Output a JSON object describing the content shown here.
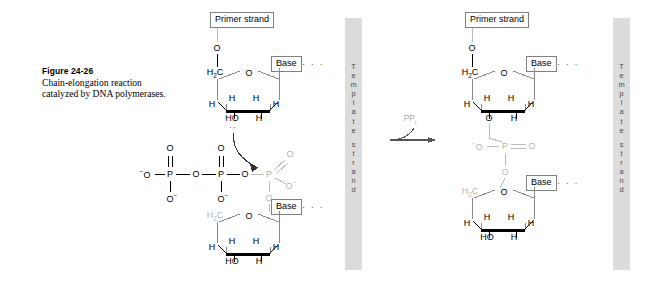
{
  "figure": {
    "number_label": "Figure 24-26",
    "caption_line1": "Chain-elongation reaction",
    "caption_line2": "catalyzed by DNA",
    "caption_line3": "polymerases."
  },
  "colors": {
    "background": "#ffffff",
    "ink": "#000000",
    "template_bar": "#dcdcdc",
    "template_text": "#4a4a4a",
    "gray_structure": "#b4b4b4",
    "box_border": "#808080"
  },
  "template_strands": [
    {
      "name": "template-strand-left",
      "text": "Template strand"
    },
    {
      "name": "template-strand-right",
      "text": "Template strand"
    }
  ],
  "reaction": {
    "byproduct_label": "PP",
    "byproduct_subscript": "i",
    "arrow_name": "reaction-arrow"
  },
  "labels": {
    "primer_strand": "Primer strand",
    "base": "Base",
    "continuation_dots": "· · ·",
    "O": "O",
    "H": "H",
    "HO": "HO",
    "P": "P",
    "H2C": "H<sub>2</sub>C",
    "O_minus": "O<sup>−</sup>",
    "minus_O": "<sup>−</sup>O"
  },
  "reactant_side": {
    "name": "reactant-structure",
    "primer_nucleotide": {
      "primer_strand_box": "Primer strand",
      "bridging_O": "O",
      "c5_label": "H2C",
      "ring_O": "O",
      "base_box": "Base",
      "base_dots": "· · ·",
      "h_labels": [
        "H",
        "H",
        "H",
        "H"
      ],
      "hydroxyl_label": "HO",
      "lone_pair": "··"
    },
    "triphosphate": {
      "terminal_O_minus": "−O",
      "phosphorus_labels": [
        "P",
        "P",
        "P"
      ],
      "bridging_O_labels": [
        "O",
        "O"
      ],
      "double_bond_O_labels": [
        "O",
        "O",
        "O"
      ],
      "O_minus_labels": [
        "O−",
        "O−",
        "O−"
      ],
      "ester_O": "O"
    },
    "incoming_nucleotide": {
      "c5_label": "H2C",
      "ring_O": "O",
      "base_box": "Base",
      "base_dots": "· · ·",
      "h_labels": [
        "H",
        "H",
        "H",
        "H"
      ],
      "hydroxyl_label": "HO"
    }
  },
  "product_side": {
    "name": "product-structure",
    "primer_nucleotide": {
      "primer_strand_box": "Primer strand",
      "bridging_O": "O",
      "c5_label": "H2C",
      "ring_O": "O",
      "base_box": "Base",
      "base_dots": "· · ·",
      "h_labels": [
        "H",
        "H",
        "H",
        "H"
      ],
      "c3_O": "O"
    },
    "phosphodiester": {
      "O_minus": "−O",
      "phosphorus": "P",
      "double_bond_O": "O",
      "ester_O": "O"
    },
    "added_nucleotide": {
      "c5_label": "H2C",
      "ring_O": "O",
      "base_box": "Base",
      "base_dots": "· · ·",
      "h_labels": [
        "H",
        "H",
        "H",
        "H"
      ],
      "hydroxyl_label": "HO"
    }
  }
}
